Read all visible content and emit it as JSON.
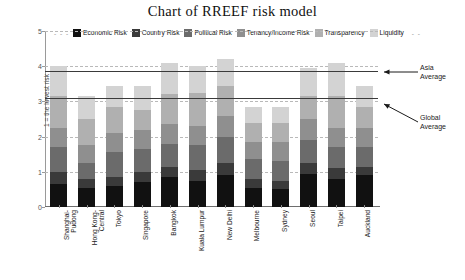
{
  "chart_data": {
    "type": "bar",
    "subtype": "stacked-bar",
    "title": "Chart of RREEF risk model",
    "xlabel": "",
    "ylabel": "1 = the lowest risk",
    "ylim": [
      0,
      5
    ],
    "yticks": [
      0,
      1,
      2,
      3,
      4,
      5
    ],
    "grid": true,
    "legend_position": "top",
    "categories": [
      "Shanghai-Pudong",
      "Hong Kong-Central",
      "Tokyo",
      "Singapore",
      "Bangkok",
      "Kuala Lumpur",
      "New Delhi",
      "Melbourne",
      "Sydney",
      "Seoul",
      "Taipei",
      "Auckland"
    ],
    "category_lines": [
      [
        "Shanghai-",
        "Pudong"
      ],
      [
        "Hong Kong-",
        "Central"
      ],
      [
        "Tokyo"
      ],
      [
        "Singapore"
      ],
      [
        "Bangkok"
      ],
      [
        "Kuala Lumpur"
      ],
      [
        "New Delhi"
      ],
      [
        "Melbourne"
      ],
      [
        "Sydney"
      ],
      [
        "Seoul"
      ],
      [
        "Taipei"
      ],
      [
        "Auckland"
      ]
    ],
    "series": [
      {
        "name": "Economic Risk",
        "color": "#111111",
        "values": [
          0.65,
          0.55,
          0.6,
          0.7,
          0.85,
          0.75,
          0.9,
          0.55,
          0.5,
          0.95,
          0.8,
          0.9
        ]
      },
      {
        "name": "Country Risk",
        "color": "#3a3a3a",
        "values": [
          0.35,
          0.25,
          0.25,
          0.3,
          0.3,
          0.3,
          0.35,
          0.25,
          0.25,
          0.3,
          0.3,
          0.25
        ]
      },
      {
        "name": "Political Risk",
        "color": "#6b6b6b",
        "values": [
          0.7,
          0.45,
          0.7,
          0.65,
          0.65,
          0.7,
          0.75,
          0.55,
          0.55,
          0.65,
          0.6,
          0.55
        ]
      },
      {
        "name": "Tenancy/Income Risk",
        "color": "#8f8f8f",
        "values": [
          0.55,
          0.5,
          0.55,
          0.55,
          0.55,
          0.55,
          0.6,
          0.5,
          0.55,
          0.6,
          0.55,
          0.55
        ]
      },
      {
        "name": "Transparency",
        "color": "#b0b0b0",
        "values": [
          0.9,
          0.75,
          0.75,
          0.55,
          0.85,
          0.95,
          0.85,
          0.55,
          0.55,
          0.65,
          0.9,
          0.6
        ]
      },
      {
        "name": "Liquidity",
        "color": "#d3d3d3",
        "values": [
          0.85,
          0.65,
          0.6,
          0.7,
          0.9,
          0.75,
          0.75,
          0.45,
          0.45,
          0.8,
          0.95,
          0.6
        ]
      }
    ],
    "totals": [
      4.0,
      3.15,
      3.45,
      3.45,
      4.1,
      4.0,
      4.2,
      2.85,
      2.85,
      3.95,
      4.1,
      3.45
    ],
    "reference_lines": [
      {
        "label": "Asia Average",
        "value": 3.85,
        "color": "#3a3a3a"
      },
      {
        "label": "Global Average",
        "value": 3.1,
        "color": "#3a3a3a"
      }
    ],
    "legend_dash_left": "- - -",
    "legend_dash_right": "- -"
  }
}
